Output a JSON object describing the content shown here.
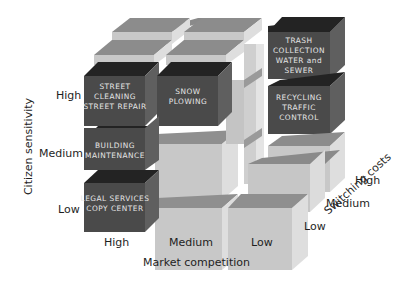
{
  "diagram": {
    "type": "3d-cube-matrix",
    "axes": {
      "x": {
        "title": "Market competition",
        "ticks": [
          "High",
          "Medium",
          "Low"
        ]
      },
      "y": {
        "title": "Citizen sensitivity",
        "ticks": [
          "High",
          "Medium",
          "Low"
        ]
      },
      "z": {
        "title": "Switching costs",
        "ticks": [
          "Low",
          "Medium",
          "High"
        ]
      }
    },
    "highlighted_cells": [
      {
        "id": "street",
        "lines": [
          "STREET",
          "CLEANING",
          "STREET REPAIR"
        ],
        "competition": "High",
        "sensitivity": "High",
        "switching": "Low"
      },
      {
        "id": "snow",
        "lines": [
          "SNOW",
          "PLOWING"
        ],
        "competition": "Medium",
        "sensitivity": "High",
        "switching": "Low"
      },
      {
        "id": "building",
        "lines": [
          "BUILDING",
          "MAINTENANCE"
        ],
        "competition": "High",
        "sensitivity": "Medium",
        "switching": "Low"
      },
      {
        "id": "legal",
        "lines": [
          "LEGAL SERVICES",
          "COPY CENTER"
        ],
        "competition": "High",
        "sensitivity": "Low",
        "switching": "Low"
      },
      {
        "id": "trash",
        "lines": [
          "TRASH",
          "COLLECTION",
          "WATER and",
          "SEWER"
        ],
        "competition": "Low",
        "sensitivity": "High",
        "switching": "High"
      },
      {
        "id": "recycling",
        "lines": [
          "RECYCLING",
          "TRAFFIC",
          "CONTROL"
        ],
        "competition": "Low",
        "sensitivity": "Medium",
        "switching": "High"
      }
    ],
    "colors": {
      "dark_front": "#4a4a4a",
      "dark_top": "#232323",
      "dark_side": "#5e5e5e",
      "light_front": "#c8c8c8",
      "light_top": "#8a8a8a",
      "light_side": "#dedede",
      "text": "#1e1e1e"
    }
  }
}
